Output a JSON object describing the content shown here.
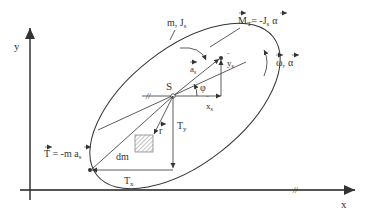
{
  "diagram": {
    "colors": {
      "line": "#333333",
      "axis": "#555555",
      "hatch": "#888888",
      "background": "#ffffff"
    },
    "axes": {
      "x_label": "x",
      "y_label": "y"
    },
    "body": {
      "mass_label": "m, J",
      "mass_label_sub": "s",
      "center_label": "S",
      "element_label": "dm",
      "position_vector_label": "r",
      "angle_label": "φ"
    },
    "inertia_moment": {
      "label_M": "M",
      "label_M_sub": "T",
      "label_eq": "= -J",
      "label_eq_sub": "s",
      "label_alpha": "α"
    },
    "rotation": {
      "label_omega": "ω",
      "label_sep": ",",
      "label_alpha": "α"
    },
    "acceleration": {
      "a_label": "a",
      "a_sub": "s",
      "xdd_label": "x",
      "xdd_sub": "s",
      "ydd_label": "y",
      "ydd_sub": "s"
    },
    "inertia_force": {
      "T_label": "T",
      "T_eq": " = -m ",
      "T_a": "a",
      "T_a_sub": "s",
      "Tx_label": "T",
      "Tx_sub": "x",
      "Ty_label": "T",
      "Ty_sub": "y"
    },
    "markers": {
      "parallel_mark": "//"
    }
  }
}
